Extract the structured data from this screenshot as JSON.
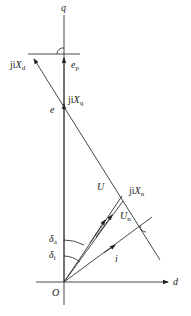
{
  "diagram": {
    "axes": {
      "q": {
        "label": "q"
      },
      "d": {
        "label": "d"
      },
      "origin": {
        "label": "O"
      }
    },
    "labels": {
      "jiXd": {
        "prefix": "ji",
        "main": "X",
        "sub": "d"
      },
      "ep": {
        "main": "e",
        "sub": "p"
      },
      "jiXq": {
        "prefix": "ji",
        "main": "X",
        "sub": "q"
      },
      "e": {
        "main": "e"
      },
      "U": {
        "main": "U"
      },
      "jiXn": {
        "prefix": "ji",
        "main": "X",
        "sub": "n"
      },
      "Un": {
        "main": "U",
        "sub": "n"
      },
      "i": {
        "main": "i"
      },
      "delta_a": {
        "main": "δ",
        "sub": "a"
      },
      "delta_i": {
        "main": "δ",
        "sub": "i"
      }
    },
    "colors": {
      "line": "#333333",
      "text": "#222222",
      "background": "#ffffff"
    }
  }
}
